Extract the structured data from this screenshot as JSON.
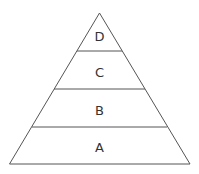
{
  "diagram": {
    "type": "pyramid",
    "levels_top_to_bottom": [
      {
        "label": "D"
      },
      {
        "label": "C"
      },
      {
        "label": "B"
      },
      {
        "label": "A"
      }
    ],
    "stroke_color": "#555555",
    "fill_color": "#ffffff"
  }
}
